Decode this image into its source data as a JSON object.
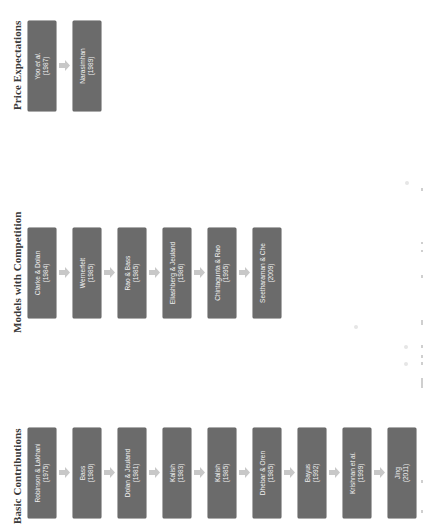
{
  "diagram": {
    "orientation": "rotated-90-ccw",
    "colors": {
      "box_fill": "#6b6b6b",
      "box_text": "#f2f2f2",
      "arrow_fill": "#c8c8c8",
      "title_text": "#3a3a3a",
      "background": "#ffffff"
    },
    "rows": [
      {
        "title": "Price Expectations",
        "boxes": [
          {
            "author": "Yoo et al.",
            "year": "(1987)"
          },
          {
            "author": "Narasimhan",
            "year": "(1989)"
          }
        ]
      },
      {
        "title": "Models with Competition",
        "boxes": [
          {
            "author": "Clarke & Dolan",
            "year": "(1984)"
          },
          {
            "author": "Wernerfelt",
            "year": "(1985)"
          },
          {
            "author": "Rao & Bass",
            "year": "(1985)"
          },
          {
            "author": "Eliashberg & Jeuland",
            "year": "(1986)"
          },
          {
            "author": "Chintagunta & Rao",
            "year": "(1995)"
          },
          {
            "author": "Seetharaman & Che",
            "year": "(2009)"
          }
        ]
      },
      {
        "title": "Basic Contributions",
        "boxes": [
          {
            "author": "Robinson & Lakhani",
            "year": "(1975)"
          },
          {
            "author": "Bass",
            "year": "(1980)"
          },
          {
            "author": "Dolan & Jeuland",
            "year": "(1981)"
          },
          {
            "author": "Kalish",
            "year": "(1983)"
          },
          {
            "author": "Kalish",
            "year": "(1985)"
          },
          {
            "author": "Dhebar & Oren",
            "year": "(1985)"
          },
          {
            "author": "Bayus",
            "year": "(1992)"
          },
          {
            "author": "Krishnan et al.",
            "year": "(1999)"
          },
          {
            "author": "Jing",
            "year": "(2011)"
          }
        ]
      }
    ]
  }
}
